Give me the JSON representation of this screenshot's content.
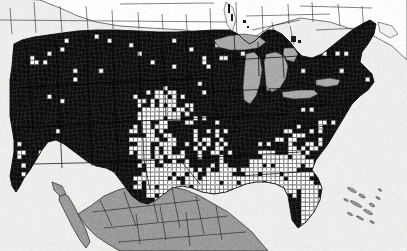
{
  "figure": {
    "title": "County-level distribution map of the contiguous United States",
    "type": "choropleth-map",
    "width": 407,
    "height": 251,
    "projection": "albers-usa-like",
    "has_border": false,
    "has_legend": false,
    "has_axis_labels": false,
    "has_title_text": false
  },
  "colors": {
    "ocean_background": "#ededea",
    "ocean_background_edge": "#e4e4e1",
    "county_present_fill": "#0d0d0d",
    "county_absent_fill": "#ffffff",
    "county_outline": "#2a2a2a",
    "state_outline": "#000000",
    "canada_fill": "#ffffff",
    "canada_outline": "#1a1a1a",
    "mexico_fill": "#9a9a9a",
    "mexico_outline": "#111111",
    "great_lakes_fill": "#a9a9a9",
    "great_lakes_outline": "#2b2b2b",
    "coastline": "#111111"
  },
  "legend_implied": {
    "present_label": "Present (shaded dark)",
    "absent_label": "Absent (unshaded white)",
    "outside_study_area_label": "Outside study area (gray)"
  },
  "regions": [
    {
      "name": "United States (contiguous)",
      "fill": "county_present_fill",
      "note": "counties individually shaded"
    },
    {
      "name": "Canada",
      "fill": "canada_fill",
      "note": "subdivision outlines only, unshaded"
    },
    {
      "name": "Mexico",
      "fill": "mexico_fill",
      "note": "state outlines, uniform gray"
    },
    {
      "name": "Great Lakes",
      "fill": "great_lakes_fill",
      "note": "water body"
    },
    {
      "name": "Atlantic Ocean",
      "fill": "ocean_background",
      "note": "background"
    },
    {
      "name": "Pacific Ocean",
      "fill": "ocean_background",
      "note": "background"
    },
    {
      "name": "Gulf of Mexico",
      "fill": "ocean_background",
      "note": "background"
    },
    {
      "name": "Bahamas / Cuba",
      "fill": "mexico_fill",
      "note": "small gray islands southeast of Florida"
    }
  ],
  "chart_data": {
    "type": "heatmap",
    "title": "",
    "xlabel": "",
    "ylabel": "",
    "description": "Binary county-level choropleth of the contiguous United States: dark counties denote presence, white counties denote absence.",
    "value_scale": [
      "absent",
      "present"
    ],
    "regional_coverage": [
      {
        "region": "Pacific Northwest (WA, OR, ID)",
        "coverage": "present",
        "absent_fraction": 0.03
      },
      {
        "region": "California",
        "coverage": "present",
        "absent_fraction": 0.05
      },
      {
        "region": "Great Basin (NV, UT)",
        "coverage": "present",
        "absent_fraction": 0.04
      },
      {
        "region": "Northern Rockies (MT, WY)",
        "coverage": "present",
        "absent_fraction": 0.06
      },
      {
        "region": "Dakotas",
        "coverage": "present",
        "absent_fraction": 0.08
      },
      {
        "region": "Upper Midwest (MN, WI, MI)",
        "coverage": "present",
        "absent_fraction": 0.1
      },
      {
        "region": "Northeast (New England, NY, PA)",
        "coverage": "present",
        "absent_fraction": 0.06
      },
      {
        "region": "Corn Belt (IA, IL, IN, OH)",
        "coverage": "present",
        "absent_fraction": 0.07
      },
      {
        "region": "High Plains (NE, KS, CO)",
        "coverage": "mixed",
        "absent_fraction": 0.42
      },
      {
        "region": "Oklahoma / North Texas",
        "coverage": "mixed",
        "absent_fraction": 0.48
      },
      {
        "region": "West Texas / Texas Panhandle",
        "coverage": "mixed",
        "absent_fraction": 0.55
      },
      {
        "region": "South Texas",
        "coverage": "mostly absent",
        "absent_fraction": 0.72
      },
      {
        "region": "Gulf Coast (LA, MS, AL)",
        "coverage": "mixed",
        "absent_fraction": 0.58
      },
      {
        "region": "Southeast (GA, SC, NC)",
        "coverage": "mixed",
        "absent_fraction": 0.5
      },
      {
        "region": "Florida",
        "coverage": "mostly absent",
        "absent_fraction": 0.88
      },
      {
        "region": "Appalachia / Mid-Atlantic",
        "coverage": "present",
        "absent_fraction": 0.12
      },
      {
        "region": "Southwest (AZ, NM)",
        "coverage": "present",
        "absent_fraction": 0.09
      }
    ]
  }
}
